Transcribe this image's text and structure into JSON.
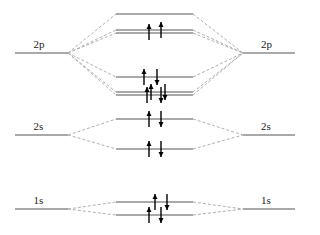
{
  "diagram": {
    "type": "molecular-orbital-diagram",
    "colors": {
      "level": "#555555",
      "dashed": "#b0b0b0",
      "arrow": "#000000"
    },
    "atomic_left": [
      {
        "label": "2p",
        "y": 53,
        "x1": 15,
        "x2": 68
      },
      {
        "label": "2s",
        "y": 135,
        "x1": 15,
        "x2": 68
      },
      {
        "label": "1s",
        "y": 209,
        "x1": 15,
        "x2": 68
      }
    ],
    "atomic_right": [
      {
        "label": "2p",
        "y": 53,
        "x1": 243,
        "x2": 295
      },
      {
        "label": "2s",
        "y": 135,
        "x1": 243,
        "x2": 295
      },
      {
        "label": "1s",
        "y": 209,
        "x1": 243,
        "x2": 295
      }
    ],
    "molecular": [
      {
        "name": "sigma-star-2p",
        "y": [
          14
        ],
        "group": "2p",
        "electrons": []
      },
      {
        "name": "pi-star-2p",
        "y": [
          30,
          33
        ],
        "group": "2p",
        "electrons": [
          {
            "x": 149,
            "dir": "up",
            "y": 32
          },
          {
            "x": 161,
            "dir": "up",
            "y": 30
          }
        ]
      },
      {
        "name": "sigma-2p",
        "y": [
          77
        ],
        "group": "2p",
        "electrons": [
          {
            "x": 144,
            "dir": "up",
            "y": 77
          },
          {
            "x": 157,
            "dir": "down",
            "y": 77
          }
        ]
      },
      {
        "name": "pi-2p",
        "y": [
          92,
          95
        ],
        "group": "2p",
        "electrons": [
          {
            "x": 147,
            "dir": "up",
            "y": 95
          },
          {
            "x": 151,
            "dir": "up",
            "y": 92
          },
          {
            "x": 161,
            "dir": "down",
            "y": 95
          },
          {
            "x": 165,
            "dir": "down",
            "y": 92
          }
        ]
      },
      {
        "name": "sigma-star-2s",
        "y": [
          119
        ],
        "group": "2s",
        "electrons": [
          {
            "x": 149,
            "dir": "up",
            "y": 119
          },
          {
            "x": 161,
            "dir": "down",
            "y": 119
          }
        ]
      },
      {
        "name": "sigma-2s",
        "y": [
          149
        ],
        "group": "2s",
        "electrons": [
          {
            "x": 149,
            "dir": "up",
            "y": 149
          },
          {
            "x": 161,
            "dir": "down",
            "y": 149
          }
        ]
      },
      {
        "name": "sigma-star-1s",
        "y": [
          202
        ],
        "group": "1s",
        "electrons": [
          {
            "x": 155,
            "dir": "up",
            "y": 202
          },
          {
            "x": 167,
            "dir": "down",
            "y": 202
          }
        ]
      },
      {
        "name": "sigma-1s",
        "y": [
          215
        ],
        "group": "1s",
        "electrons": [
          {
            "x": 149,
            "dir": "up",
            "y": 215
          },
          {
            "x": 161,
            "dir": "down",
            "y": 215
          }
        ]
      }
    ],
    "mo_x1": 116,
    "mo_x2": 193
  }
}
